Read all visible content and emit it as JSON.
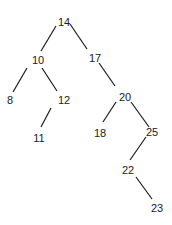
{
  "diagram": {
    "type": "binary-search-tree",
    "line_color": "#1a1a1a",
    "nodes": [
      {
        "id": "n14",
        "label": "14",
        "x": 64,
        "y": 22
      },
      {
        "id": "n10",
        "label": "10",
        "x": 38,
        "y": 60
      },
      {
        "id": "n17",
        "label": "17",
        "x": 95,
        "y": 58
      },
      {
        "id": "n8",
        "label": "8",
        "x": 10,
        "y": 100
      },
      {
        "id": "n12",
        "label": "12",
        "x": 64,
        "y": 100
      },
      {
        "id": "n20",
        "label": "20",
        "x": 125,
        "y": 97
      },
      {
        "id": "n11",
        "label": "11",
        "x": 39,
        "y": 138
      },
      {
        "id": "n18",
        "label": "18",
        "x": 100,
        "y": 133
      },
      {
        "id": "n25",
        "label": "25",
        "x": 152,
        "y": 132
      },
      {
        "id": "n22",
        "label": "22",
        "x": 128,
        "y": 170
      },
      {
        "id": "n23",
        "label": "23",
        "x": 157,
        "y": 208
      }
    ],
    "edges": [
      {
        "from": "14",
        "to": "10",
        "x1": 56,
        "y1": 26,
        "x2": 41,
        "y2": 51
      },
      {
        "from": "14",
        "to": "17",
        "x1": 70,
        "y1": 24,
        "x2": 87,
        "y2": 49
      },
      {
        "from": "10",
        "to": "8",
        "x1": 27,
        "y1": 68,
        "x2": 13,
        "y2": 92
      },
      {
        "from": "10",
        "to": "12",
        "x1": 42,
        "y1": 68,
        "x2": 57,
        "y2": 91
      },
      {
        "from": "17",
        "to": "20",
        "x1": 99,
        "y1": 63,
        "x2": 115,
        "y2": 86
      },
      {
        "from": "12",
        "to": "11",
        "x1": 51,
        "y1": 108,
        "x2": 41,
        "y2": 127
      },
      {
        "from": "20",
        "to": "18",
        "x1": 116,
        "y1": 102,
        "x2": 103,
        "y2": 122
      },
      {
        "from": "20",
        "to": "25",
        "x1": 131,
        "y1": 102,
        "x2": 149,
        "y2": 127
      },
      {
        "from": "25",
        "to": "22",
        "x1": 146,
        "y1": 137,
        "x2": 130,
        "y2": 160
      },
      {
        "from": "22",
        "to": "23",
        "x1": 136,
        "y1": 177,
        "x2": 152,
        "y2": 199
      }
    ]
  }
}
